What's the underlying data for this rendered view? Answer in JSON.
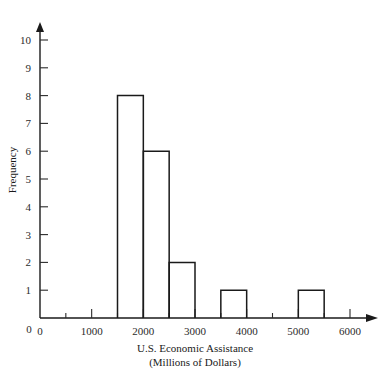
{
  "chart_data": {
    "type": "bar",
    "title": "",
    "subtitle": "",
    "xlabel_line1": "U.S. Economic Assistance",
    "xlabel_line2": "(Millions of Dollars)",
    "ylabel": "Frequency",
    "grid": false,
    "legend": false,
    "xlim": [
      0,
      6000
    ],
    "ylim": [
      0,
      10
    ],
    "bin_width": 500,
    "x_major_ticks": [
      0,
      1000,
      2000,
      3000,
      4000,
      5000,
      6000
    ],
    "x_major_tick_labels": [
      "0",
      "1000",
      "2000",
      "3000",
      "4000",
      "5000",
      "6000"
    ],
    "x_minor_ticks": [
      500,
      1500,
      2500,
      3500,
      4500,
      5500
    ],
    "y_ticks": [
      1,
      2,
      3,
      4,
      5,
      6,
      7,
      8,
      9,
      10
    ],
    "y_tick_labels": [
      "1",
      "2",
      "3",
      "4",
      "5",
      "6",
      "7",
      "8",
      "9",
      "10"
    ],
    "y_zero_label": "0",
    "bins": [
      {
        "start": 1500,
        "end": 2000,
        "frequency": 8
      },
      {
        "start": 2000,
        "end": 2500,
        "frequency": 6
      },
      {
        "start": 2500,
        "end": 3000,
        "frequency": 2
      },
      {
        "start": 3500,
        "end": 4000,
        "frequency": 1
      },
      {
        "start": 5000,
        "end": 5500,
        "frequency": 1
      }
    ],
    "categories": [
      "1500-2000",
      "2000-2500",
      "2500-3000",
      "3500-4000",
      "5000-5500"
    ],
    "values": [
      8,
      6,
      2,
      1,
      1
    ],
    "colors": {
      "axis": "#1a1a1a",
      "bar_stroke": "#1a1a1a",
      "bar_fill": "none",
      "text": "#2b2b2b",
      "background": "#ffffff"
    }
  }
}
